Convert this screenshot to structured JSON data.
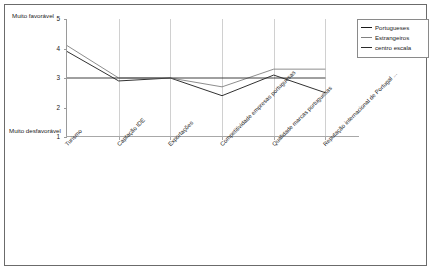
{
  "chart_data": {
    "type": "line",
    "title": "",
    "subtitle": "",
    "xlabel": "",
    "ylabel": "",
    "ylim": [
      1,
      5
    ],
    "yticks": [
      "1",
      "2",
      "3",
      "4",
      "5"
    ],
    "grid": "vertical-only",
    "legend_position": "top-right",
    "axis_top_note": "Muito favorável",
    "axis_bottom_note": "Muito desfavorável",
    "categories": [
      "Turismo",
      "Captação IDE",
      "Exportações",
      "Competitividade empresas portuguesas",
      "Qualidade marcas portuguesas",
      "Reputação internacional de Portugal ..."
    ],
    "series": [
      {
        "name": "Portugueses",
        "color": "#1a1a1a",
        "values": [
          3.9,
          2.9,
          3.0,
          2.4,
          3.1,
          2.5
        ]
      },
      {
        "name": "Estrangeiros",
        "color": "#808080",
        "values": [
          4.1,
          3.0,
          3.0,
          2.7,
          3.3,
          3.3
        ]
      },
      {
        "name": "centro escala",
        "color": "#2b2b2b",
        "values": [
          3.0,
          3.0,
          3.0,
          3.0,
          3.0,
          3.0
        ]
      }
    ]
  },
  "legend": {
    "items": [
      {
        "label": "Portugueses",
        "color": "#1a1a1a"
      },
      {
        "label": "Estrangeiros",
        "color": "#808080"
      },
      {
        "label": "centro escala",
        "color": "#2b2b2b"
      }
    ]
  },
  "colors": {
    "frame": "#6b6b6b",
    "gridline": "#d0d0d0",
    "axis": "#9a9a9a",
    "background": "#ffffff"
  }
}
